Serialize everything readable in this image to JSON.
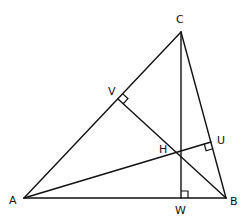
{
  "diagram": {
    "type": "geometry",
    "stroke_color": "#111111",
    "points": {
      "A": {
        "label": "A",
        "x": 24,
        "y": 198,
        "lx": 9,
        "ly": 204
      },
      "B": {
        "label": "B",
        "x": 226,
        "y": 198,
        "lx": 230,
        "ly": 205
      },
      "C": {
        "label": "C",
        "x": 181,
        "y": 32,
        "lx": 176,
        "ly": 23
      },
      "V": {
        "label": "V",
        "x": 118,
        "y": 99,
        "lx": 108,
        "ly": 95
      },
      "U": {
        "label": "U",
        "x": 211,
        "y": 142,
        "lx": 217,
        "ly": 144
      },
      "W": {
        "label": "W",
        "x": 181,
        "y": 198,
        "lx": 175,
        "ly": 214
      },
      "H": {
        "label": "H",
        "x": 181,
        "y": 152,
        "lx": 159,
        "ly": 153
      }
    },
    "segments": [
      [
        "A",
        "B"
      ],
      [
        "B",
        "C"
      ],
      [
        "C",
        "A"
      ],
      [
        "A",
        "U"
      ],
      [
        "B",
        "V"
      ],
      [
        "C",
        "W"
      ]
    ],
    "right_angles": [
      "V",
      "U",
      "W"
    ]
  }
}
